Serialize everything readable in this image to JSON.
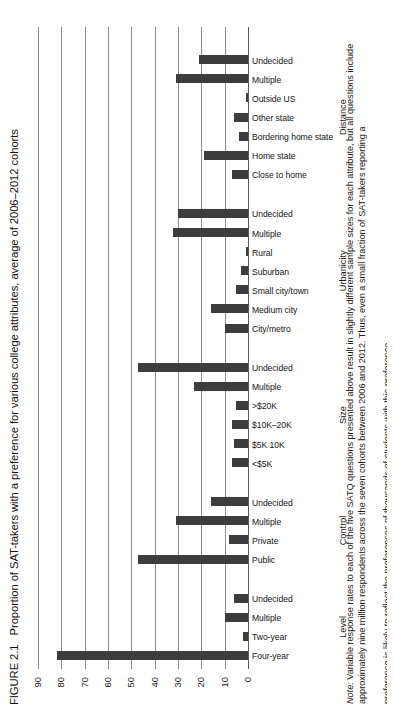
{
  "figure": {
    "number": "FIGURE 2.1",
    "title": "Proportion of SAT-takers with a preference for various college attributes, average of 2006–2012 cohorts"
  },
  "note": {
    "label": "Note:",
    "line1": "Variable response rates to each of the five SATQ questions presented above result in slightly different sample sizes for each attribute, but all questions",
    "line2": "include approximately nine million respondents across the seven cohorts between 2006 and 2012. Thus, even a small fraction of SAT-takers reporting a",
    "line3": "preference is likely to reflect the preferences of thousands of students with this preference."
  },
  "chart_data": {
    "type": "bar",
    "title": "Proportion of SAT-takers with a preference for various college attributes, average of 2006–2012 cohorts",
    "xlabel": "",
    "ylabel": "",
    "ylim": [
      0,
      90
    ],
    "yticks": [
      "0",
      "10",
      "20",
      "30",
      "40",
      "50",
      "60",
      "70",
      "80",
      "90"
    ],
    "grid": true,
    "legend": "none",
    "orientation": "vertical",
    "bar_color": "#3d3d3d",
    "groups": [
      {
        "name": "Level",
        "categories": [
          "Four-year",
          "Two-year",
          "Multiple",
          "Undecided"
        ],
        "values": [
          82,
          2,
          10,
          6
        ]
      },
      {
        "name": "Control",
        "categories": [
          "Public",
          "Private",
          "Multiple",
          "Undecided"
        ],
        "values": [
          47,
          8,
          31,
          16
        ]
      },
      {
        "name": "Size",
        "categories": [
          "<$5K",
          "$5K 10K",
          "$10K–20K",
          ">$20K",
          "Multiple",
          "Undecided"
        ],
        "values": [
          7,
          6,
          7,
          5,
          23,
          47
        ]
      },
      {
        "name": "Urbanicity",
        "categories": [
          "City/metro",
          "Medium city",
          "Small city/town",
          "Suburban",
          "Rural",
          "Multiple",
          "Undecided"
        ],
        "values": [
          10,
          16,
          5,
          3,
          1,
          32,
          30
        ]
      },
      {
        "name": "Distance",
        "categories": [
          "Close to home",
          "Home state",
          "Bordering home state",
          "Other state",
          "Outside US",
          "Multiple",
          "Undecided"
        ],
        "values": [
          7,
          19,
          4,
          6,
          1,
          31,
          21
        ]
      }
    ]
  }
}
